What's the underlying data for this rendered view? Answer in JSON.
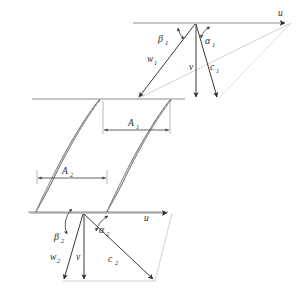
{
  "figure": {
    "line_color": "#3a3a3a",
    "faint_color": "#b9b9b9",
    "blade_fill": "#f4f4f4",
    "text_color": "#2b2b2b"
  },
  "inlet_triangle": {
    "u_label": "u",
    "u_sub": "",
    "w_label": "w",
    "w_sub": "1",
    "v_label": "v",
    "v_sub": "",
    "c_label": "c",
    "c_sub": "1",
    "beta_label": "β",
    "beta_sub": "1",
    "alpha_label": "α",
    "alpha_sub": "1"
  },
  "outlet_triangle": {
    "u_label": "u",
    "u_sub": "",
    "w_label": "w",
    "w_sub": "2",
    "v_label": "v",
    "v_sub": "",
    "c_label": "c",
    "c_sub": "2",
    "beta_label": "β",
    "beta_sub": "2",
    "alpha_label": "α",
    "alpha_sub": "2"
  },
  "dimensions": {
    "a1_label": "A",
    "a1_sub": "1",
    "a2_label": "A",
    "a2_sub": "2"
  }
}
